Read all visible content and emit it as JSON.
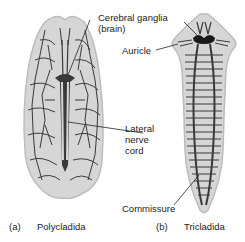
{
  "figure": {
    "panels": [
      {
        "letter": "(a)",
        "name": "Polycladida"
      },
      {
        "letter": "(b)",
        "name": "Tricladida"
      }
    ],
    "labels": {
      "cerebral_ganglia_line1": "Cerebral ganglia",
      "cerebral_ganglia_line2": "(brain)",
      "auricle": "Auricle",
      "lateral_nerve_cord_line1": "Lateral",
      "lateral_nerve_cord_line2": "nerve",
      "lateral_nerve_cord_line3": "cord",
      "commissure": "Commissure"
    },
    "colors": {
      "body_fill": "#d6d6d6",
      "body_edge": "#bcbcbc",
      "nerve": "#3a3a3a",
      "text": "#222222"
    }
  }
}
